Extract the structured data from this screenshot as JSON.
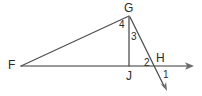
{
  "figure": {
    "width": 202,
    "height": 96,
    "background_color": "#ffffff",
    "stroke_color": "#595959",
    "text_color": "#2b2b2b"
  },
  "points": {
    "F": {
      "label": "F",
      "x": 21,
      "y": 66,
      "label_x": 8,
      "label_y": 59
    },
    "G": {
      "label": "G",
      "x": 129,
      "y": 16,
      "label_x": 124,
      "label_y": 2
    },
    "H": {
      "label": "H",
      "x": 155,
      "y": 66,
      "label_x": 156,
      "label_y": 52
    },
    "J": {
      "label": "J",
      "x": 129,
      "y": 66,
      "label_x": 126,
      "label_y": 70
    }
  },
  "segments": [
    {
      "name": "segment-FG",
      "from": "F",
      "to": "G"
    },
    {
      "name": "segment-GJ",
      "from": "G",
      "to": "J"
    },
    {
      "name": "ray-FH-right",
      "from": "F",
      "to": "right-arrow-tip"
    },
    {
      "name": "ray-GH-down",
      "from": "G",
      "to": "down-arrow-tip"
    }
  ],
  "arrows": {
    "right_arrow": {
      "name": "right-arrow",
      "tip_x": 194,
      "tip_y": 66
    },
    "down_arrow": {
      "name": "down-arrow",
      "tip_x": 167,
      "tip_y": 91
    }
  },
  "angle_labels": [
    {
      "id": "1",
      "label": "1",
      "x": 163,
      "y": 70
    },
    {
      "id": "2",
      "label": "2",
      "x": 144,
      "y": 58
    },
    {
      "id": "3",
      "label": "3",
      "x": 131,
      "y": 32
    },
    {
      "id": "4",
      "label": "4",
      "x": 119,
      "y": 20
    }
  ]
}
